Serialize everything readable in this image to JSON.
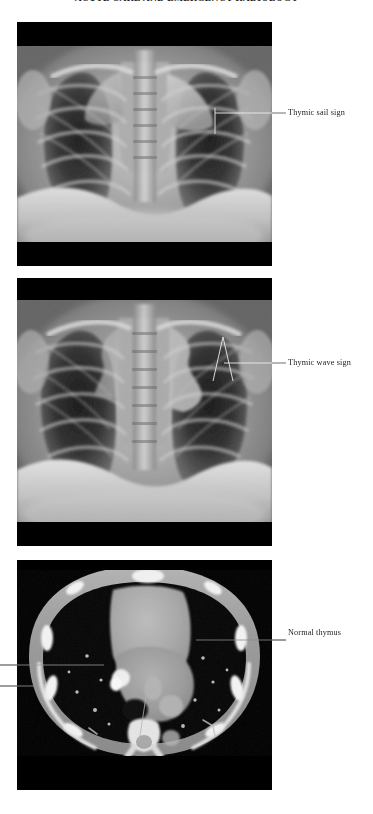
{
  "page": {
    "width": 373,
    "height": 814,
    "background": "#ffffff",
    "running_head": "ACUTE CARE AND EMERGENCY RADIOLOGY"
  },
  "figure": {
    "panels": [
      {
        "id": "panel-1",
        "modality": "chest-radiograph",
        "description": "Frontal pediatric chest radiograph showing the thymic sail sign",
        "letterbox_color": "#000000"
      },
      {
        "id": "panel-2",
        "modality": "chest-radiograph",
        "description": "Frontal pediatric chest radiograph showing the thymic wave sign",
        "letterbox_color": "#000000"
      },
      {
        "id": "panel-3",
        "modality": "chest-ct-axial",
        "description": "Axial contrast enhanced chest CT showing a normal thymus",
        "letterbox_color": "#000000"
      }
    ],
    "annotations": [
      {
        "id": "label-sail",
        "text": "Thymic sail sign",
        "panel": "panel-1",
        "side": "right",
        "leader": {
          "x1": 272,
          "y1": 113,
          "x2": 286,
          "y2": 113
        },
        "marker": {
          "type": "tick-down",
          "x": 215,
          "y_top": 108,
          "y_bottom": 133
        },
        "marker_rule": {
          "x1": 215,
          "y1": 113,
          "x2": 272,
          "y2": 113
        },
        "color": "#e8e8e8"
      },
      {
        "id": "label-wave",
        "text": "Thymic wave sign",
        "panel": "panel-2",
        "side": "right",
        "leader": {
          "x1": 272,
          "y1": 363,
          "x2": 286,
          "y2": 363
        },
        "marker": {
          "type": "chevron",
          "apex_x": 222,
          "apex_y": 338,
          "left_x": 212,
          "left_y": 378,
          "right_x": 232,
          "right_y": 378
        },
        "marker_rule": {
          "x1": 222,
          "y1": 363,
          "x2": 272,
          "y2": 363
        },
        "color": "#e8e8e8"
      },
      {
        "id": "label-thymus",
        "text": "Normal thymus",
        "panel": "panel-3",
        "side": "right",
        "leader": {
          "x1": 196,
          "y1": 640,
          "x2": 286,
          "y2": 640
        },
        "color": "#d8d8d8"
      },
      {
        "id": "leader-left-upper",
        "text": "",
        "panel": "panel-3",
        "side": "left-cropped",
        "leader": {
          "x1": 0,
          "y1": 665,
          "x2": 104,
          "y2": 665
        },
        "color": "#d8d8d8"
      },
      {
        "id": "leader-left-lower",
        "text": "",
        "panel": "panel-3",
        "side": "left-cropped",
        "leader": {
          "x1": 0,
          "y1": 686,
          "x2": 38,
          "y2": 686
        },
        "color": "#d8d8d8"
      },
      {
        "id": "leader-bottom-center",
        "text": "",
        "panel": "panel-3",
        "side": "bottom-cropped",
        "leader": {
          "x1": 147,
          "y1": 692,
          "x2": 139,
          "y2": 740
        },
        "color": "#d8d8d8"
      }
    ]
  },
  "colors": {
    "page_background": "#ffffff",
    "letterbox": "#000000",
    "label_text": "#1c1c1c",
    "leader_line_dark": "#5a5a5a",
    "leader_line_light": "#e8e8e8",
    "soft_tissue": "#9a9a9a",
    "lung_field": "#2b2b2b",
    "bone_bright": "#f2f2f2"
  }
}
